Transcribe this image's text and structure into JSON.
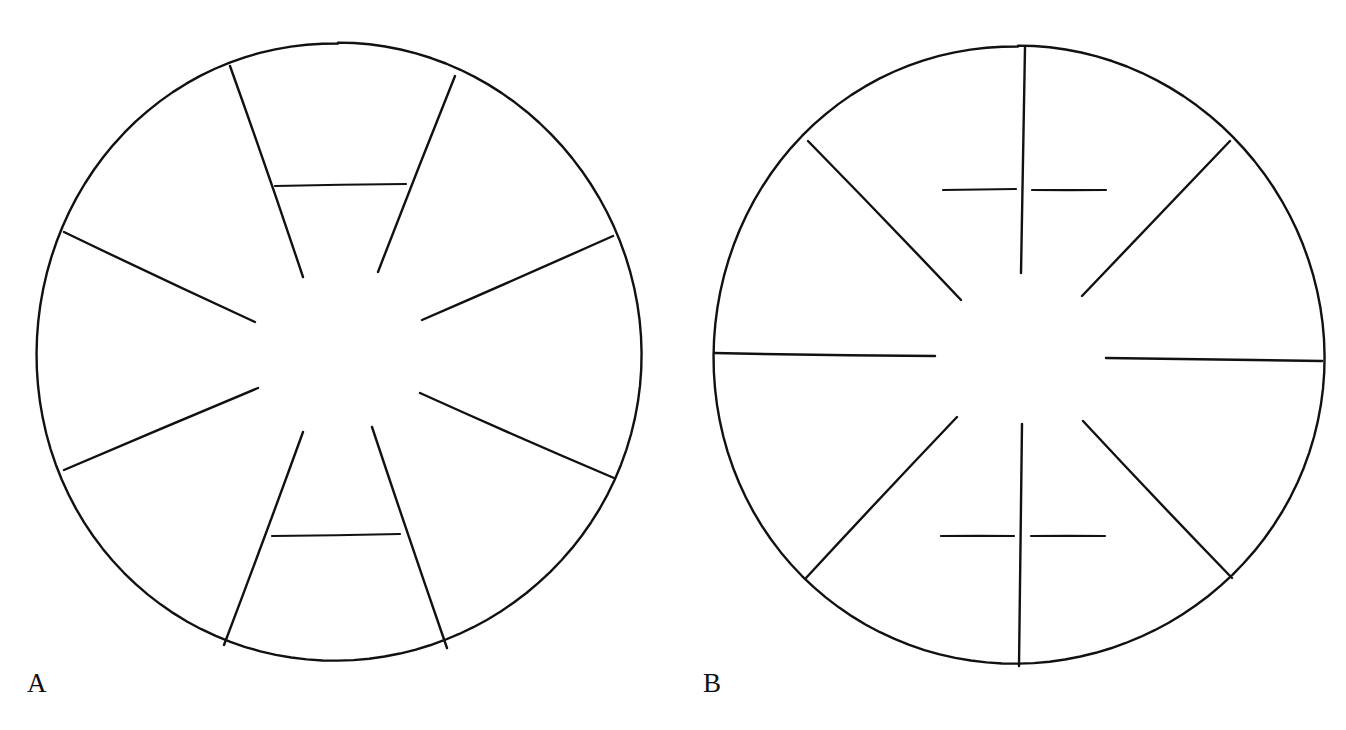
{
  "figure": {
    "background_color": "#ffffff",
    "stroke_color": "#111111",
    "width": 1346,
    "height": 730
  },
  "panels": [
    {
      "id": "A",
      "label": "A",
      "label_position": {
        "x": 27,
        "y": 670
      },
      "circle": {
        "center_x": 338,
        "center_y": 353,
        "radius_x": 301,
        "radius_y": 310,
        "stroke_width": 2.4,
        "has_center_vertical_spoke": false
      },
      "spokes": [
        {
          "name": "spoke-upper-left-steep",
          "outer_x": 230,
          "outer_y": 66,
          "inner_x": 303,
          "inner_y": 277
        },
        {
          "name": "spoke-upper-right-steep",
          "outer_x": 455,
          "outer_y": 76,
          "inner_x": 378,
          "inner_y": 272
        },
        {
          "name": "spoke-left-upper-diagonal",
          "outer_x": 64,
          "outer_y": 232,
          "inner_x": 255,
          "inner_y": 322
        },
        {
          "name": "spoke-right-upper-diagonal",
          "outer_x": 613,
          "outer_y": 236,
          "inner_x": 422,
          "inner_y": 320
        },
        {
          "name": "spoke-left-lower-diagonal",
          "outer_x": 64,
          "outer_y": 470,
          "inner_x": 258,
          "inner_y": 388
        },
        {
          "name": "spoke-right-lower-diagonal",
          "outer_x": 614,
          "outer_y": 478,
          "inner_x": 420,
          "inner_y": 393
        },
        {
          "name": "spoke-lower-left-steep",
          "outer_x": 224,
          "outer_y": 645,
          "inner_x": 303,
          "inner_y": 432
        },
        {
          "name": "spoke-lower-right-steep",
          "outer_x": 447,
          "outer_y": 648,
          "inner_x": 372,
          "inner_y": 427
        }
      ],
      "bridges": [
        {
          "name": "bridge-top",
          "x1": 275,
          "y1": 186,
          "x2": 406,
          "y2": 184
        },
        {
          "name": "bridge-bottom",
          "x1": 272,
          "y1": 536,
          "x2": 400,
          "y2": 534
        }
      ],
      "sector_count": 10,
      "center_gap": true
    },
    {
      "id": "B",
      "label": "B",
      "label_position": {
        "x": 703,
        "y": 670
      },
      "circle": {
        "center_x": 1018,
        "center_y": 356,
        "radius_x": 304,
        "radius_y": 310,
        "stroke_width": 2.4,
        "has_center_vertical_spoke": true
      },
      "spokes": [
        {
          "name": "spoke-vertical-top",
          "outer_x": 1025,
          "outer_y": 47,
          "inner_x": 1021,
          "inner_y": 273
        },
        {
          "name": "spoke-vertical-bottom",
          "outer_x": 1019,
          "outer_y": 666,
          "inner_x": 1022,
          "inner_y": 424
        },
        {
          "name": "spoke-upper-left-diagonal",
          "outer_x": 808,
          "outer_y": 141,
          "inner_x": 961,
          "inner_y": 300
        },
        {
          "name": "spoke-upper-right-diagonal",
          "outer_x": 1230,
          "outer_y": 141,
          "inner_x": 1082,
          "inner_y": 296
        },
        {
          "name": "spoke-left-horizontal",
          "outer_x": 714,
          "outer_y": 353,
          "inner_x": 935,
          "inner_y": 356
        },
        {
          "name": "spoke-right-horizontal",
          "outer_x": 1322,
          "outer_y": 361,
          "inner_x": 1106,
          "inner_y": 358
        },
        {
          "name": "spoke-lower-left-diagonal",
          "outer_x": 806,
          "outer_y": 578,
          "inner_x": 957,
          "inner_y": 417
        },
        {
          "name": "spoke-lower-right-diagonal",
          "outer_x": 1232,
          "outer_y": 578,
          "inner_x": 1083,
          "inner_y": 421
        }
      ],
      "bridges": [
        {
          "name": "bridge-top-left",
          "x1": 943,
          "y1": 190,
          "x2": 1016,
          "y2": 189
        },
        {
          "name": "bridge-top-right",
          "x1": 1032,
          "y1": 190,
          "x2": 1106,
          "y2": 190
        },
        {
          "name": "bridge-bottom-left",
          "x1": 941,
          "y1": 536,
          "x2": 1014,
          "y2": 536
        },
        {
          "name": "bridge-bottom-right",
          "x1": 1031,
          "y1": 536,
          "x2": 1105,
          "y2": 536
        }
      ],
      "sector_count": 8,
      "center_gap": true
    }
  ]
}
